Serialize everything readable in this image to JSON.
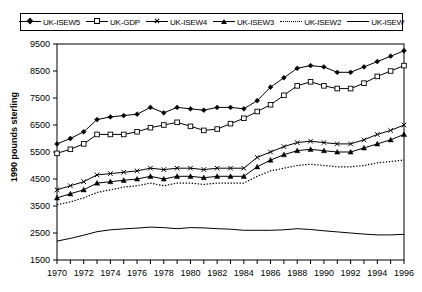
{
  "chart_data": {
    "type": "line",
    "title": "",
    "xlabel": "",
    "ylabel": "1990 pounds sterling",
    "xlim": [
      1970,
      1996
    ],
    "ylim": [
      1500,
      9500
    ],
    "yticks": [
      1500,
      2500,
      3500,
      4500,
      5500,
      6500,
      7500,
      8500,
      9500
    ],
    "xticks": [
      1970,
      1971,
      1972,
      1973,
      1974,
      1975,
      1976,
      1977,
      1978,
      1979,
      1980,
      1981,
      1982,
      1983,
      1984,
      1985,
      1986,
      1987,
      1988,
      1989,
      1990,
      1991,
      1992,
      1993,
      1994,
      1995,
      1996
    ],
    "xtick_labels_shown": [
      1970,
      1972,
      1974,
      1976,
      1978,
      1980,
      1982,
      1984,
      1986,
      1988,
      1990,
      1992,
      1994,
      1996
    ],
    "grid": false,
    "legend_position": "top",
    "x": [
      1970,
      1971,
      1972,
      1973,
      1974,
      1975,
      1976,
      1977,
      1978,
      1979,
      1980,
      1981,
      1982,
      1983,
      1984,
      1985,
      1986,
      1987,
      1988,
      1989,
      1990,
      1991,
      1992,
      1993,
      1994,
      1995,
      1996
    ],
    "series": [
      {
        "name": "UK-ISEW5",
        "marker": "filled-diamond",
        "line": "solid",
        "values": [
          5800,
          6000,
          6250,
          6700,
          6800,
          6850,
          6900,
          7150,
          6950,
          7150,
          7100,
          7050,
          7150,
          7150,
          7100,
          7400,
          7900,
          8250,
          8600,
          8700,
          8650,
          8450,
          8450,
          8650,
          8850,
          9050,
          9250
        ]
      },
      {
        "name": "UK-GDP",
        "marker": "open-square",
        "line": "solid",
        "values": [
          5450,
          5600,
          5800,
          6150,
          6150,
          6150,
          6250,
          6400,
          6500,
          6600,
          6450,
          6300,
          6350,
          6550,
          6750,
          7000,
          7250,
          7600,
          7950,
          8100,
          7950,
          7850,
          7850,
          8050,
          8300,
          8500,
          8700
        ]
      },
      {
        "name": "UK-ISEW4",
        "marker": "cross",
        "line": "solid",
        "values": [
          4100,
          4250,
          4400,
          4650,
          4700,
          4750,
          4800,
          4900,
          4850,
          4900,
          4900,
          4850,
          4900,
          4900,
          4900,
          5300,
          5500,
          5700,
          5850,
          5900,
          5850,
          5800,
          5800,
          5950,
          6150,
          6300,
          6500
        ]
      },
      {
        "name": "UK-ISEW3",
        "marker": "filled-triangle",
        "line": "solid",
        "values": [
          3800,
          3950,
          4100,
          4350,
          4400,
          4450,
          4500,
          4600,
          4500,
          4600,
          4600,
          4550,
          4600,
          4600,
          4600,
          4950,
          5200,
          5400,
          5550,
          5600,
          5550,
          5500,
          5500,
          5650,
          5800,
          5950,
          6150
        ]
      },
      {
        "name": "UK-ISEW2",
        "marker": "none",
        "line": "dotted",
        "values": [
          3550,
          3650,
          3800,
          4000,
          4100,
          4200,
          4250,
          4350,
          4250,
          4350,
          4350,
          4300,
          4350,
          4350,
          4350,
          4600,
          4800,
          4900,
          5000,
          5050,
          5000,
          4950,
          4950,
          5000,
          5100,
          5150,
          5200
        ]
      },
      {
        "name": "UK-ISEW",
        "marker": "none",
        "line": "solid",
        "values": [
          2200,
          2300,
          2420,
          2550,
          2620,
          2650,
          2680,
          2720,
          2700,
          2660,
          2700,
          2690,
          2660,
          2640,
          2600,
          2600,
          2600,
          2620,
          2660,
          2630,
          2580,
          2540,
          2500,
          2460,
          2430,
          2430,
          2450
        ]
      }
    ]
  },
  "legend": {
    "entries": [
      {
        "label": "UK-ISEW5"
      },
      {
        "label": "UK-GDP"
      },
      {
        "label": "UK-ISEW4"
      },
      {
        "label": "UK-ISEW3"
      },
      {
        "label": "UK-ISEW2"
      },
      {
        "label": "UK-ISEW"
      }
    ]
  },
  "axes": {
    "ylabel": "1990 pounds sterling"
  },
  "colors": {
    "line": "#000000",
    "background": "#ffffff",
    "text": "#000000"
  }
}
